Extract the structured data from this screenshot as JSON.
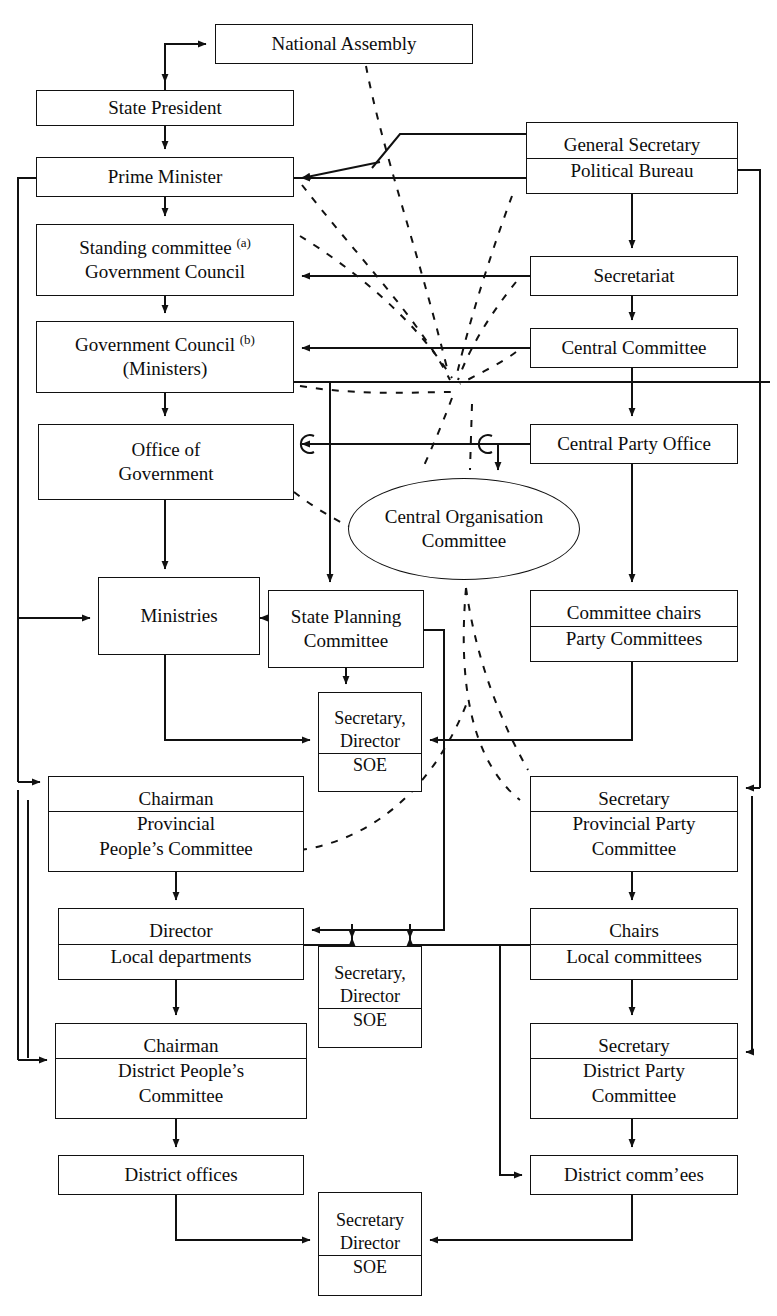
{
  "diagram": {
    "title_fragment": "",
    "type": "organisational-chart",
    "orientation": "vertical",
    "columns": [
      "State / Government (left)",
      "Party (right)",
      "Shared enterprises (centre)"
    ],
    "footnote_markers": [
      "(a)",
      "(b)"
    ],
    "nodes": [
      {
        "id": "national-assembly",
        "lines": [
          "National Assembly"
        ],
        "x": 215,
        "y": 24,
        "w": 258,
        "h": 40,
        "shape": "rect"
      },
      {
        "id": "state-president",
        "lines": [
          "State President"
        ],
        "x": 36,
        "y": 90,
        "w": 258,
        "h": 36,
        "shape": "rect"
      },
      {
        "id": "prime-minister",
        "lines": [
          "Prime Minister"
        ],
        "x": 36,
        "y": 157,
        "w": 258,
        "h": 40,
        "shape": "rect"
      },
      {
        "id": "standing-committee",
        "lines": [
          "Standing committee (a)",
          "Government Council"
        ],
        "x": 36,
        "y": 224,
        "w": 258,
        "h": 72,
        "shape": "rect",
        "sup": 0
      },
      {
        "id": "government-council",
        "lines": [
          "Government Council (b)",
          "(Ministers)"
        ],
        "x": 36,
        "y": 321,
        "w": 258,
        "h": 72,
        "shape": "rect",
        "sup": 0
      },
      {
        "id": "office-of-government",
        "lines": [
          "Office of",
          "Government"
        ],
        "x": 38,
        "y": 424,
        "w": 256,
        "h": 76,
        "shape": "rect"
      },
      {
        "id": "ministries",
        "lines": [
          "Ministries"
        ],
        "x": 98,
        "y": 577,
        "w": 162,
        "h": 78,
        "shape": "rect"
      },
      {
        "id": "state-planning",
        "lines": [
          "State Planning",
          "Committee"
        ],
        "x": 268,
        "y": 590,
        "w": 156,
        "h": 78,
        "shape": "rect"
      },
      {
        "id": "soe-central",
        "lines": [
          "Secretary,",
          "Director",
          "SOE"
        ],
        "x": 318,
        "y": 692,
        "w": 104,
        "h": 100,
        "shape": "rect",
        "sep_from": 2
      },
      {
        "id": "prov-people-committee",
        "lines": [
          "Chairman",
          "Provincial",
          "People’s Committee"
        ],
        "x": 48,
        "y": 776,
        "w": 256,
        "h": 96,
        "shape": "rect",
        "sep_from": 1
      },
      {
        "id": "prov-director",
        "lines": [
          "Director",
          "Local departments"
        ],
        "x": 58,
        "y": 908,
        "w": 246,
        "h": 72,
        "shape": "rect",
        "sep_from": 1
      },
      {
        "id": "soe-district-mid",
        "lines": [
          "Secretary,",
          "Director",
          "SOE"
        ],
        "x": 318,
        "y": 946,
        "w": 104,
        "h": 102,
        "shape": "rect",
        "sep_from": 2
      },
      {
        "id": "district-people-committee",
        "lines": [
          "Chairman",
          "District People’s",
          "Committee"
        ],
        "x": 55,
        "y": 1023,
        "w": 252,
        "h": 96,
        "shape": "rect",
        "sep_from": 1
      },
      {
        "id": "district-offices",
        "lines": [
          "District offices"
        ],
        "x": 58,
        "y": 1155,
        "w": 246,
        "h": 40,
        "shape": "rect"
      },
      {
        "id": "soe-bottom",
        "lines": [
          "Secretary",
          "Director",
          "SOE"
        ],
        "x": 318,
        "y": 1192,
        "w": 104,
        "h": 104,
        "shape": "rect",
        "sep_from": 2
      },
      {
        "id": "general-secretary",
        "lines": [
          "General Secretary",
          "Political Bureau"
        ],
        "x": 526,
        "y": 122,
        "w": 212,
        "h": 72,
        "shape": "rect",
        "sep_from": 1
      },
      {
        "id": "secretariat",
        "lines": [
          "Secretariat"
        ],
        "x": 530,
        "y": 256,
        "w": 208,
        "h": 40,
        "shape": "rect"
      },
      {
        "id": "central-committee",
        "lines": [
          "Central Committee"
        ],
        "x": 530,
        "y": 328,
        "w": 208,
        "h": 40,
        "shape": "rect"
      },
      {
        "id": "central-party-office",
        "lines": [
          "Central Party Office"
        ],
        "x": 530,
        "y": 424,
        "w": 208,
        "h": 40,
        "shape": "rect"
      },
      {
        "id": "central-organisation",
        "lines": [
          "Central Organisation",
          "Committee"
        ],
        "x": 348,
        "y": 478,
        "w": 232,
        "h": 102,
        "shape": "ellipse"
      },
      {
        "id": "committee-chairs",
        "lines": [
          "Committee chairs",
          "Party Committees"
        ],
        "x": 530,
        "y": 590,
        "w": 208,
        "h": 72,
        "shape": "rect",
        "sep_from": 1
      },
      {
        "id": "prov-party-committee",
        "lines": [
          "Secretary",
          "Provincial Party",
          "Committee"
        ],
        "x": 530,
        "y": 776,
        "w": 208,
        "h": 96,
        "shape": "rect",
        "sep_from": 1
      },
      {
        "id": "local-chairs",
        "lines": [
          "Chairs",
          "Local committees"
        ],
        "x": 530,
        "y": 908,
        "w": 208,
        "h": 72,
        "shape": "rect",
        "sep_from": 1
      },
      {
        "id": "district-party-committee",
        "lines": [
          "Secretary",
          "District Party",
          "Committee"
        ],
        "x": 530,
        "y": 1023,
        "w": 208,
        "h": 96,
        "shape": "rect",
        "sep_from": 1
      },
      {
        "id": "district-committees",
        "lines": [
          "District comm’ees"
        ],
        "x": 530,
        "y": 1155,
        "w": 208,
        "h": 40,
        "shape": "rect"
      }
    ],
    "legend": {
      "solid_line": "direct administrative line",
      "dashed_line": "personnel / appointment influence",
      "hop_marker": "C"
    }
  }
}
